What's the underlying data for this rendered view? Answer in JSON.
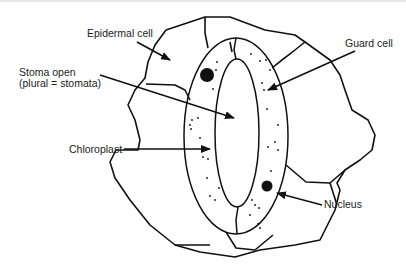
{
  "diagram": {
    "labels": {
      "epidermal_cell": "Epidermal cell",
      "stoma_open_line1": "Stoma open",
      "stoma_open_line2": "(plural = stomata)",
      "guard_cell": "Guard cell",
      "chloroplast": "Chloroplast",
      "nucleus": "Nucleus"
    },
    "colors": {
      "stroke": "#111111",
      "background": "#ffffff",
      "text": "#222222"
    }
  }
}
